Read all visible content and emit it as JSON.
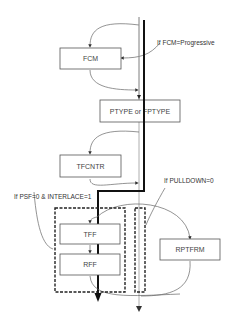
{
  "diagram": {
    "boxes": {
      "fcm": "FCM",
      "ptype": "PTYPE or FPTYPE",
      "tfcntr": "TFCNTR",
      "tff": "TFF",
      "rff": "RFF",
      "rptfrm": "RPTFRM"
    },
    "conditions": {
      "fcm_progressive": "If FCM=Progressive",
      "psf_interlace": "If PSF=0 & INTERLACE=1",
      "pulldown": "If PULLDOWN=0"
    },
    "colors": {
      "main_path": "#111111",
      "alt_path": "#999999",
      "box_border": "#555555"
    }
  }
}
